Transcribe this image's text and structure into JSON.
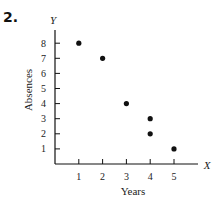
{
  "problem_number": "2.",
  "chart_data": {
    "type": "scatter",
    "title": "",
    "xlabel": "Years",
    "ylabel": "Absences",
    "x_axis_letter": "X",
    "y_axis_letter": "Y",
    "x_ticks": [
      1,
      2,
      3,
      4,
      5
    ],
    "y_ticks": [
      1,
      2,
      3,
      4,
      5,
      6,
      7,
      8
    ],
    "xlim": [
      0,
      6
    ],
    "ylim": [
      0,
      9
    ],
    "grid": false,
    "points": [
      {
        "x": 1,
        "y": 8
      },
      {
        "x": 2,
        "y": 7
      },
      {
        "x": 3,
        "y": 4
      },
      {
        "x": 4,
        "y": 3
      },
      {
        "x": 4,
        "y": 2
      },
      {
        "x": 5,
        "y": 1
      }
    ]
  },
  "colors": {
    "ink": "#111111",
    "background": "#ffffff"
  }
}
